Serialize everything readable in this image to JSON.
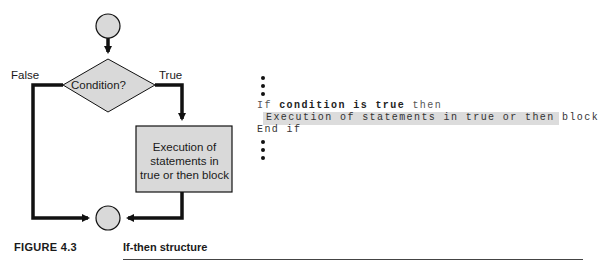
{
  "flowchart": {
    "decision_label": "Condition?",
    "false_label": "False",
    "true_label": "True",
    "process_lines": [
      "Execution of",
      "statements in",
      "true or then block"
    ],
    "colors": {
      "fill": "#d9d9d9",
      "stroke": "#111111"
    }
  },
  "pseudocode": {
    "line1": {
      "kw_if": "If",
      "cond": "condition is true",
      "kw_then": "then"
    },
    "line2": "Execution of statements in true or then block",
    "line3": "End if",
    "highlight_color": "#dcdcdc"
  },
  "caption": {
    "figure": "FIGURE 4.3",
    "title": "If-then structure"
  }
}
